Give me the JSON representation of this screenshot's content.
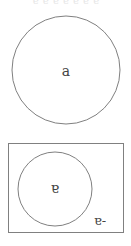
{
  "header": {
    "text": "ɐ ɐ ɐ ɐ ɐ ɐ ɐ"
  },
  "diagram": {
    "stroke_color": "#808080",
    "text_color": "#444444",
    "top_circle": {
      "label": "a",
      "cx": 66,
      "cy": 70,
      "r": 54
    },
    "bottom_panel": {
      "box": {
        "x": 8,
        "y": 143,
        "width": 115,
        "height": 89
      },
      "circle": {
        "label": "ɐ",
        "cx": 55,
        "cy": 189,
        "r": 37
      },
      "outside_label": "ɐ-"
    }
  }
}
